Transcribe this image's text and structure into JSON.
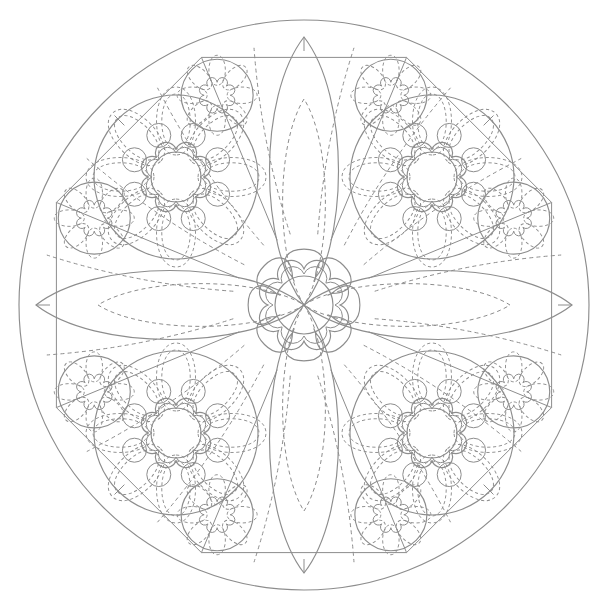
{
  "page": {
    "type": "line-art-coloring-sheet",
    "width": 608,
    "height": 612,
    "background_color": "#ffffff",
    "stroke_color": "#8d8d8d"
  },
  "geometry": {
    "center": {
      "x": 304,
      "y": 305
    },
    "outer_circle_radius": 285,
    "inner_polygon_radius": 268,
    "polygon_sides": 8,
    "symmetry_fold": 8
  },
  "elements": {
    "outer_circle": {
      "name": "outer-boundary-circle",
      "radius": 285
    },
    "inner_octagon": {
      "name": "inner-octagon",
      "radius": 268,
      "sides": 8
    },
    "octagon_ticks": {
      "name": "octagon-vertex-ticks",
      "count": 8,
      "length": 14
    },
    "axis_lens": {
      "name": "axis-leaf-petal",
      "count": 4,
      "angles_deg": [
        0,
        90,
        180,
        270
      ],
      "tip_radius": 268,
      "half_width": 46,
      "inner_dashed": true
    },
    "diagonal_rays": {
      "name": "diagonal-ray-lines",
      "count": 8,
      "solid": true,
      "dashed_pairs": 8
    },
    "center_flower": {
      "name": "center-flower",
      "petals": 8,
      "outer_radius": 78,
      "petal_width": 30,
      "scallop_ring_lobes": 8,
      "scallop_outer_radius": 42,
      "scallop_inner_radius": 37,
      "core_circle_radius": 29
    },
    "large_medallions": {
      "name": "large-flower-medallion",
      "count": 4,
      "orbit_radius": 181,
      "angles_deg": [
        45,
        135,
        225,
        315
      ],
      "outer_circle_radius": 82,
      "dashed_petals": 8,
      "petal_length": 68,
      "petal_width": 26,
      "small_circles": 8,
      "small_circle_radius": 12,
      "small_circle_orbit": 45,
      "scallop_lobes": 8,
      "scallop_outer_radius": 35,
      "core_circle_radius": 25
    },
    "small_medallions": {
      "name": "small-flower-medallion",
      "count": 8,
      "orbit_radius": 227,
      "angles_deg": [
        22.5,
        67.5,
        112.5,
        157.5,
        202.5,
        247.5,
        292.5,
        337.5
      ],
      "outer_circle_radius": 36,
      "dashed_petals": 8,
      "petal_length": 30,
      "petal_width": 11,
      "scallop_lobes": 8,
      "scallop_radius": 15
    }
  },
  "palette": {
    "stroke": "#8d8d8d",
    "stroke_light": "#9a9a9a",
    "fill": "#ffffff",
    "page": "#ffffff"
  }
}
